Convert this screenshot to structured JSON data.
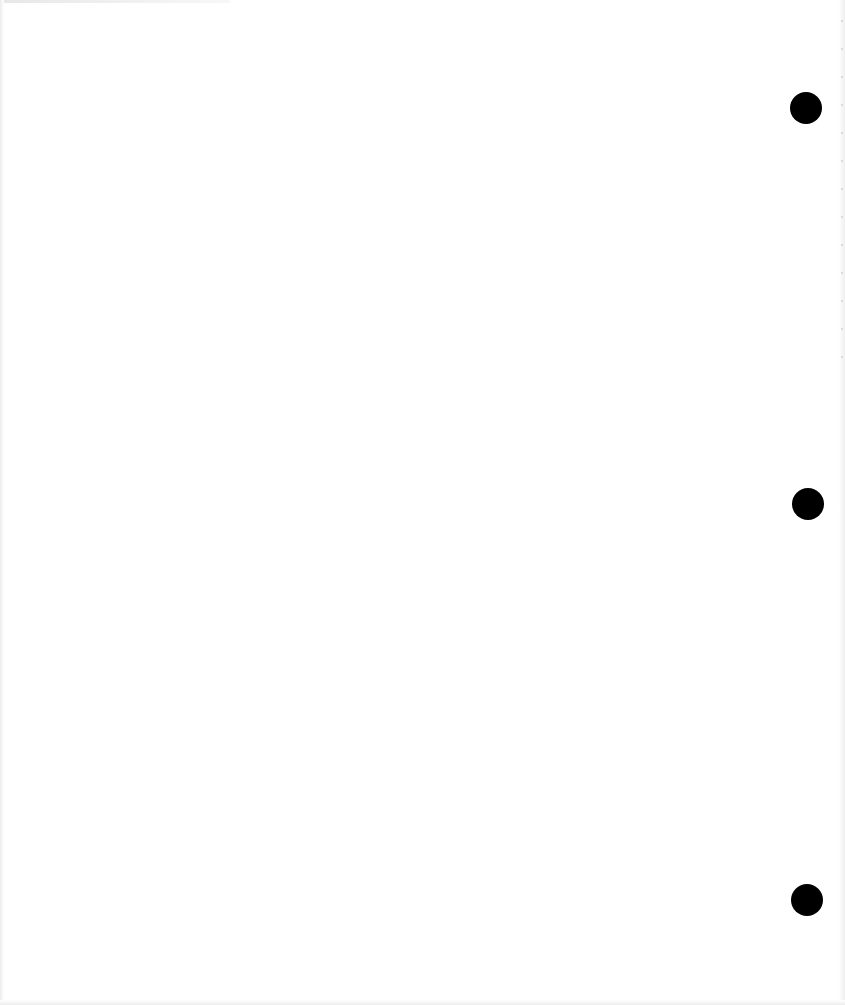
{
  "document": {
    "type": "blank scanned page",
    "content_text": "",
    "punch_holes": [
      {
        "id": 1,
        "position": "top-right"
      },
      {
        "id": 2,
        "position": "middle-right"
      },
      {
        "id": 3,
        "position": "bottom-right"
      }
    ],
    "colors": {
      "paper": "#ffffff",
      "hole": "#000000"
    }
  }
}
